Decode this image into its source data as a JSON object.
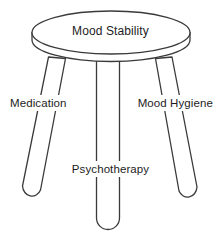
{
  "diagram": {
    "type": "three-legged-stool-metaphor",
    "title": "Mood Stability",
    "background_color": "#ffffff",
    "stroke_color": "#3a3a3a",
    "text_color": "#1d1d1d",
    "seat": {
      "label": "Mood Stability"
    },
    "legs": [
      {
        "id": "left",
        "label": "Medication"
      },
      {
        "id": "center",
        "label": "Psychotherapy"
      },
      {
        "id": "right",
        "label": "Mood Hygiene"
      }
    ]
  }
}
